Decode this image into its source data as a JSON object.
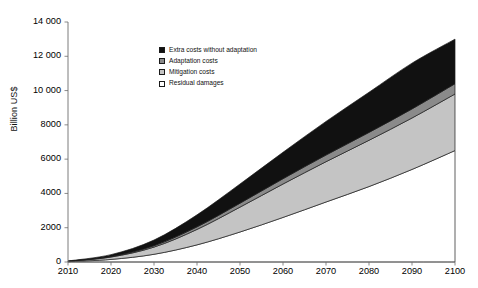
{
  "chart_data": {
    "type": "area",
    "title": "",
    "subtitle": "",
    "xlabel": "",
    "ylabel": "Billion US$",
    "xlim": [
      2010,
      2100
    ],
    "ylim": [
      0,
      14000
    ],
    "grid": false,
    "stacked": true,
    "legend_position": "inside-upper-left",
    "xticks": [
      "2010",
      "2020",
      "2030",
      "2040",
      "2050",
      "2060",
      "2070",
      "2080",
      "2090",
      "2100"
    ],
    "yticks": [
      "0",
      "2000",
      "4000",
      "6000",
      "8000",
      "10 000",
      "12 000",
      "14 000"
    ],
    "x": [
      2010,
      2020,
      2030,
      2040,
      2050,
      2060,
      2070,
      2080,
      2090,
      2100
    ],
    "series": [
      {
        "name": "Residual damages",
        "color": "#ffffff",
        "values": [
          20,
          150,
          450,
          1000,
          1750,
          2600,
          3500,
          4400,
          5400,
          6500
        ]
      },
      {
        "name": "Mitigation costs",
        "color": "#c4c4c4",
        "values": [
          20,
          140,
          420,
          900,
          1450,
          1950,
          2350,
          2700,
          3000,
          3300
        ]
      },
      {
        "name": "Adaptation costs",
        "color": "#8a8a8a",
        "values": [
          5,
          30,
          80,
          150,
          230,
          310,
          390,
          460,
          530,
          600
        ]
      },
      {
        "name": "Extra costs without adaptation",
        "color": "#111111",
        "values": [
          15,
          110,
          330,
          700,
          1120,
          1540,
          1960,
          2340,
          2670,
          2600
        ]
      }
    ],
    "cumulative_top": [
      60,
      430,
      1280,
      2750,
      4550,
      6400,
      8200,
      9900,
      11600,
      13000
    ],
    "annotations": []
  },
  "legend": {
    "items": [
      {
        "label": "Extra costs without adaptation",
        "swatch": "black-swatch"
      },
      {
        "label": "Adaptation costs",
        "swatch": "dark-gray-swatch"
      },
      {
        "label": "Mitigation costs",
        "swatch": "light-gray-swatch"
      },
      {
        "label": "Residual damages",
        "swatch": "white-swatch"
      }
    ]
  },
  "axis": {
    "y_title": "Billion US$"
  }
}
